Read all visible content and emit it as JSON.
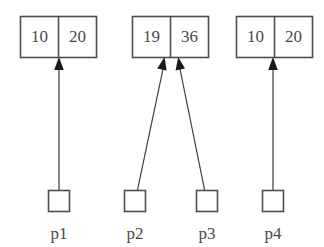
{
  "diagram": {
    "background_color": "#ffffff",
    "line_color": "#4d4d4d",
    "text_color": "#4a4a4a",
    "arrow_color": "#1a1a1a",
    "boxes": [
      {
        "id": "box-1",
        "cells": [
          {
            "id": "box-1-cell-1",
            "value": "10"
          },
          {
            "id": "box-1-cell-2",
            "value": "20"
          }
        ]
      },
      {
        "id": "box-2",
        "cells": [
          {
            "id": "box-2-cell-1",
            "value": "19"
          },
          {
            "id": "box-2-cell-2",
            "value": "36"
          }
        ]
      },
      {
        "id": "box-3",
        "cells": [
          {
            "id": "box-3-cell-1",
            "value": "10"
          },
          {
            "id": "box-3-cell-2",
            "value": "20"
          }
        ]
      }
    ],
    "pointers": [
      {
        "id": "pointer-p1",
        "label": "p1",
        "target_box": "box-1",
        "target_cell": "box-1-cell-2"
      },
      {
        "id": "pointer-p2",
        "label": "p2",
        "target_box": "box-2",
        "target_cell": "box-2-cell-1"
      },
      {
        "id": "pointer-p3",
        "label": "p3",
        "target_box": "box-2",
        "target_cell": "box-2-cell-2"
      },
      {
        "id": "pointer-p4",
        "label": "p4",
        "target_box": "box-3",
        "target_cell": "box-3-cell-2"
      }
    ]
  }
}
